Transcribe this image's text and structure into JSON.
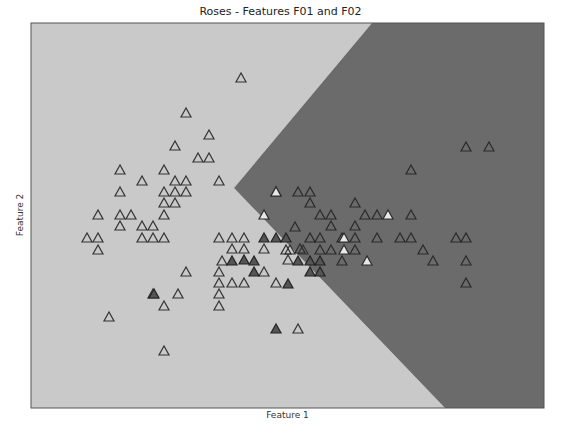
{
  "chart_data": {
    "type": "scatter",
    "title": "Roses - Features F01 and F02",
    "xlabel": "Feature 1",
    "ylabel": "Feature 2",
    "grid": false,
    "legend": null,
    "ticks": "hidden",
    "plot_area_px": {
      "left": 31,
      "top": 23,
      "right": 544,
      "bottom": 408
    },
    "decision_regions": [
      {
        "name": "class-a-region",
        "color": "#c9c9c9",
        "polygon_px": [
          [
            31,
            23
          ],
          [
            372,
            23
          ],
          [
            234,
            188
          ],
          [
            445,
            408
          ],
          [
            31,
            408
          ]
        ]
      },
      {
        "name": "class-b-region",
        "color": "#6b6b6b",
        "polygon_px": [
          [
            372,
            23
          ],
          [
            544,
            23
          ],
          [
            544,
            408
          ],
          [
            445,
            408
          ],
          [
            234,
            188
          ]
        ]
      }
    ],
    "marker": "triangle",
    "series": [
      {
        "name": "hollow-triangles",
        "fill": "none",
        "stroke": "#333333",
        "points_px": [
          [
            241,
            78
          ],
          [
            186,
            113
          ],
          [
            209,
            135
          ],
          [
            175,
            146
          ],
          [
            198,
            158
          ],
          [
            209,
            158
          ],
          [
            120,
            170
          ],
          [
            164,
            170
          ],
          [
            175,
            181
          ],
          [
            186,
            181
          ],
          [
            219,
            181
          ],
          [
            142,
            181
          ],
          [
            120,
            192
          ],
          [
            164,
            192
          ],
          [
            175,
            192
          ],
          [
            186,
            192
          ],
          [
            164,
            203
          ],
          [
            175,
            203
          ],
          [
            98,
            215
          ],
          [
            120,
            215
          ],
          [
            131,
            215
          ],
          [
            164,
            215
          ],
          [
            120,
            226
          ],
          [
            142,
            226
          ],
          [
            153,
            226
          ],
          [
            87,
            238
          ],
          [
            98,
            238
          ],
          [
            142,
            238
          ],
          [
            153,
            238
          ],
          [
            164,
            238
          ],
          [
            219,
            238
          ],
          [
            98,
            250
          ],
          [
            232,
            238
          ],
          [
            244,
            238
          ],
          [
            232,
            249
          ],
          [
            244,
            249
          ],
          [
            186,
            272
          ],
          [
            219,
            272
          ],
          [
            219,
            283
          ],
          [
            232,
            283
          ],
          [
            244,
            283
          ],
          [
            153,
            294
          ],
          [
            178,
            294
          ],
          [
            219,
            294
          ],
          [
            219,
            306
          ],
          [
            109,
            317
          ],
          [
            164,
            306
          ],
          [
            164,
            351
          ],
          [
            264,
            249
          ],
          [
            264,
            272
          ],
          [
            276,
            283
          ],
          [
            298,
            329
          ],
          [
            290,
            250
          ],
          [
            288,
            260
          ],
          [
            222,
            261
          ],
          [
            303,
            250
          ]
        ]
      },
      {
        "name": "dark-filled-triangles",
        "fill": "#555555",
        "stroke": "#222222",
        "points_px": [
          [
            264,
            238
          ],
          [
            276,
            238
          ],
          [
            286,
            238
          ],
          [
            232,
            261
          ],
          [
            254,
            261
          ],
          [
            254,
            272
          ],
          [
            154,
            294
          ],
          [
            244,
            260
          ],
          [
            288,
            284
          ],
          [
            276,
            329
          ],
          [
            298,
            261
          ],
          [
            310,
            261
          ],
          [
            320,
            261
          ],
          [
            310,
            272
          ],
          [
            320,
            272
          ]
        ]
      },
      {
        "name": "hollow-on-dark",
        "fill": "none",
        "stroke": "#2a2a2a",
        "points_px": [
          [
            466,
            147
          ],
          [
            489,
            147
          ],
          [
            411,
            170
          ],
          [
            276,
            192
          ],
          [
            298,
            192
          ],
          [
            310,
            192
          ],
          [
            310,
            203
          ],
          [
            355,
            203
          ],
          [
            320,
            215
          ],
          [
            331,
            215
          ],
          [
            365,
            215
          ],
          [
            355,
            226
          ],
          [
            377,
            215
          ],
          [
            411,
            215
          ],
          [
            331,
            226
          ],
          [
            355,
            238
          ],
          [
            295,
            227
          ],
          [
            310,
            238
          ],
          [
            320,
            238
          ],
          [
            377,
            238
          ],
          [
            400,
            238
          ],
          [
            411,
            238
          ],
          [
            456,
            238
          ],
          [
            466,
            238
          ],
          [
            423,
            250
          ],
          [
            433,
            261
          ],
          [
            466,
            261
          ],
          [
            466,
            283
          ],
          [
            286,
            250
          ],
          [
            300,
            249
          ],
          [
            320,
            250
          ],
          [
            331,
            250
          ],
          [
            342,
            261
          ],
          [
            342,
            238
          ],
          [
            355,
            250
          ]
        ]
      },
      {
        "name": "light-filled-triangles",
        "fill": "#e8e8e8",
        "stroke": "#2a2a2a",
        "points_px": [
          [
            276,
            192
          ],
          [
            388,
            215
          ],
          [
            344,
            238
          ],
          [
            344,
            250
          ],
          [
            367,
            261
          ],
          [
            264,
            215
          ]
        ]
      }
    ]
  },
  "labels": {
    "title": "Roses - Features F01 and F02",
    "xlabel": "Feature 1",
    "ylabel": "Feature 2"
  }
}
